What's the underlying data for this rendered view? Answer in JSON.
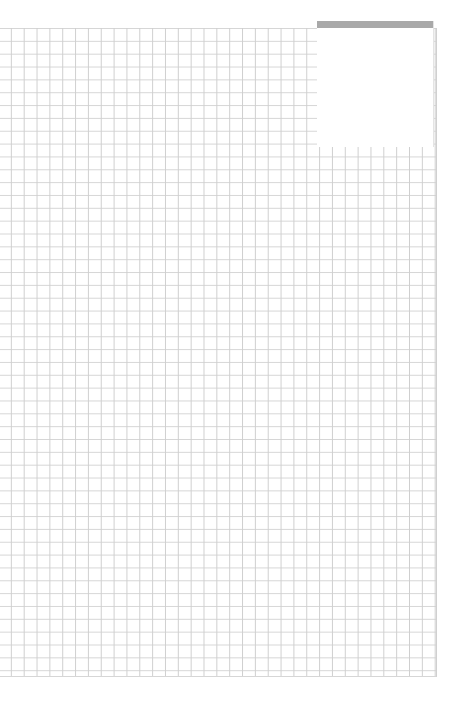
{
  "page": {
    "type": "graph-paper",
    "grid_color": "#d0d0d0",
    "background_color": "#ffffff",
    "grid_cell_px": 13
  },
  "label_box": {
    "bar_color": "#a9a9a9",
    "text": ""
  }
}
